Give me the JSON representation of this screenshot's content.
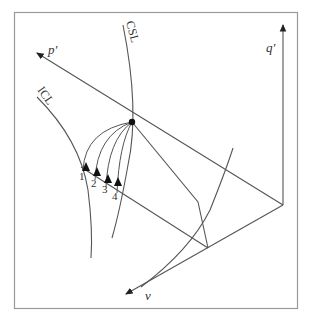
{
  "diagram": {
    "axes": {
      "p": "p′",
      "q": "q′",
      "v": "v"
    },
    "curves": {
      "csl": "CSL",
      "icl": "ICL"
    },
    "path_labels": [
      "1",
      "2",
      "3",
      "4"
    ],
    "colors": {
      "line": "#555555",
      "frame": "#999999",
      "point": "#111111"
    }
  }
}
